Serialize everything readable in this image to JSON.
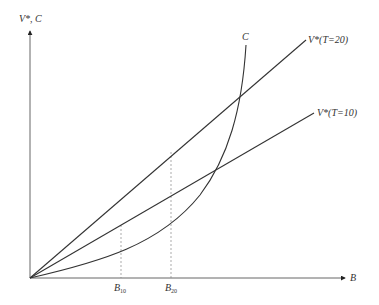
{
  "diagram": {
    "y_axis_label": "V*, C",
    "x_axis_label": "B",
    "curves": [
      {
        "id": "C",
        "label": "C",
        "type": "convex cost curve"
      },
      {
        "id": "V20",
        "label": "V*(T=20)",
        "type": "line"
      },
      {
        "id": "V10",
        "label": "V*(T=10)",
        "type": "line"
      }
    ],
    "x_markers": [
      {
        "label": "B",
        "subscript": "10"
      },
      {
        "label": "B",
        "subscript": "20"
      }
    ],
    "colors": {
      "line": "#333333",
      "axis": "#555555",
      "dashed": "#888888"
    }
  }
}
